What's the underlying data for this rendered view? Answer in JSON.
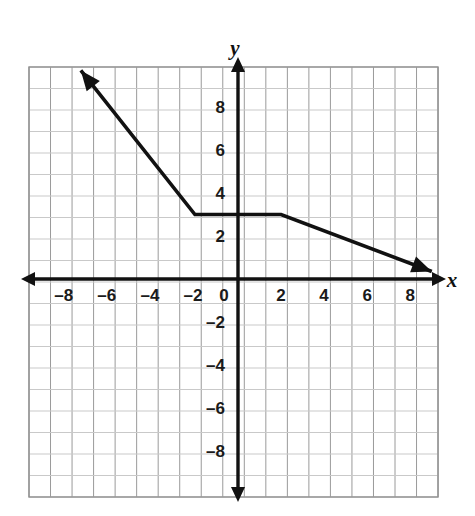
{
  "figure": {
    "kind": "coordinate-grid-graph",
    "background_color": "#ffffff",
    "grid_color": "#9a9a9a",
    "minor_grid_color": "#c9c9c9",
    "axis_color": "#111111",
    "curve_color": "#111111"
  },
  "axes": {
    "x_axis_label": "x",
    "y_axis_label": "y",
    "origin_label": "0",
    "x_tick_labels": [
      "–8",
      "–6",
      "–4",
      "–2",
      "2",
      "4",
      "6",
      "8"
    ],
    "y_tick_labels": [
      "8",
      "6",
      "4",
      "2",
      "–2",
      "–4",
      "–6",
      "–8"
    ]
  },
  "chart_data": {
    "type": "line",
    "title": "",
    "xlabel": "x",
    "ylabel": "y",
    "xlim": [
      -9.5,
      9.5
    ],
    "ylim": [
      -10,
      10
    ],
    "grid": true,
    "grid_step": 1,
    "legend": "none",
    "x_ticks": [
      -8,
      -6,
      -4,
      -2,
      0,
      2,
      4,
      6,
      8
    ],
    "y_ticks": [
      -8,
      -6,
      -4,
      -2,
      2,
      4,
      6,
      8
    ],
    "series": [
      {
        "name": "piecewise function",
        "style": "solid",
        "width": 3,
        "arrow_start": true,
        "arrow_end": true,
        "points": [
          {
            "x": -7.3,
            "y": 9.7
          },
          {
            "x": -2,
            "y": 3
          },
          {
            "x": 2,
            "y": 3
          },
          {
            "x": 9.0,
            "y": 0.35
          }
        ],
        "segments": [
          {
            "from": [
              -7.3,
              9.7
            ],
            "to": [
              -2,
              3
            ],
            "slope": -1.5,
            "note": "ray extending up-left with arrowhead"
          },
          {
            "from": [
              -2,
              3
            ],
            "to": [
              2,
              3
            ],
            "slope": 0,
            "note": "horizontal segment at y = 3"
          },
          {
            "from": [
              2,
              3
            ],
            "to": [
              9.0,
              0.35
            ],
            "slope": -0.38,
            "note": "ray extending down-right with arrowhead"
          }
        ]
      }
    ]
  }
}
